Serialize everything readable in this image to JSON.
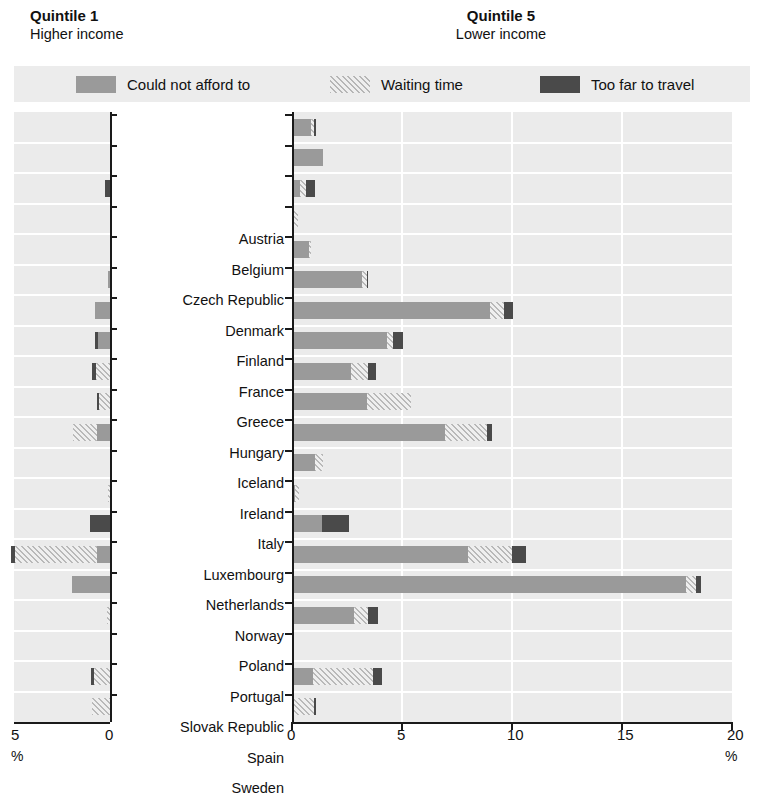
{
  "headers": {
    "left": {
      "title": "Quintile 1",
      "subtitle": "Higher income"
    },
    "right": {
      "title": "Quintile 5",
      "subtitle": "Lower income"
    }
  },
  "legend": {
    "items": [
      {
        "key": "afford",
        "label": "Could not afford to",
        "color": "#9a9a9a"
      },
      {
        "key": "wait",
        "label": "Waiting time",
        "color": "#d8d8d8"
      },
      {
        "key": "travel",
        "label": "Too far to travel",
        "color": "#4a4a4a"
      }
    ]
  },
  "axes": {
    "left": {
      "labels": [
        "5",
        "0"
      ],
      "unit": "%",
      "min": 0,
      "max": 5,
      "ticks": [
        5,
        0
      ],
      "direction": "reversed"
    },
    "right": {
      "labels": [
        "0",
        "5",
        "10",
        "15",
        "20"
      ],
      "unit": "%",
      "min": 0,
      "max": 20,
      "ticks": [
        0,
        5,
        10,
        15,
        20
      ]
    }
  },
  "countries": [
    "Austria",
    "Belgium",
    "Czech Republic",
    "Denmark",
    "Finland",
    "France",
    "Greece",
    "Hungary",
    "Iceland",
    "Ireland",
    "Italy",
    "Luxembourg",
    "Netherlands",
    "Norway",
    "Poland",
    "Portugal",
    "Slovak Republic",
    "Spain",
    "Sweden",
    "United Kingdom"
  ],
  "chart_data": {
    "type": "bar",
    "orientation": "horizontal",
    "layout": "paired-diverging-stacked",
    "title": "",
    "xlabel": "%",
    "ylabel": "",
    "grid": true,
    "legend_position": "top",
    "series": [
      "Could not afford to",
      "Waiting time",
      "Too far to travel"
    ],
    "panels": [
      {
        "name": "Quintile 1",
        "subtitle": "Higher income",
        "xlim": [
          0,
          5
        ],
        "reversed": true,
        "values": {
          "Austria": {
            "afford": 0.0,
            "wait": 0.0,
            "travel": 0.0
          },
          "Belgium": {
            "afford": 0.0,
            "wait": 0.0,
            "travel": 0.0
          },
          "Czech Republic": {
            "afford": 0.0,
            "wait": 0.0,
            "travel": 0.25
          },
          "Denmark": {
            "afford": 0.0,
            "wait": 0.0,
            "travel": 0.0
          },
          "Finland": {
            "afford": 0.0,
            "wait": 0.0,
            "travel": 0.0
          },
          "France": {
            "afford": 0.05,
            "wait": 0.0,
            "travel": 0.0
          },
          "Greece": {
            "afford": 0.8,
            "wait": 0.0,
            "travel": 0.0
          },
          "Hungary": {
            "afford": 0.6,
            "wait": 0.0,
            "travel": 0.2
          },
          "Iceland": {
            "afford": 0.0,
            "wait": 0.75,
            "travel": 0.2
          },
          "Ireland": {
            "afford": 0.0,
            "wait": 0.55,
            "travel": 0.15
          },
          "Italy": {
            "afford": 0.7,
            "wait": 1.25,
            "travel": 0.0
          },
          "Luxembourg": {
            "afford": 0.0,
            "wait": 0.0,
            "travel": 0.0
          },
          "Netherlands": {
            "afford": 0.0,
            "wait": 0.1,
            "travel": 0.0
          },
          "Norway": {
            "afford": 0.0,
            "wait": 0.0,
            "travel": 1.05
          },
          "Poland": {
            "afford": 0.7,
            "wait": 4.25,
            "travel": 0.2
          },
          "Portugal": {
            "afford": 2.0,
            "wait": 0.0,
            "travel": 0.0
          },
          "Slovak Republic": {
            "afford": 0.0,
            "wait": 0.15,
            "travel": 0.0
          },
          "Spain": {
            "afford": 0.0,
            "wait": 0.0,
            "travel": 0.0
          },
          "Sweden": {
            "afford": 0.0,
            "wait": 0.85,
            "travel": 0.15
          },
          "United Kingdom": {
            "afford": 0.0,
            "wait": 0.95,
            "travel": 0.0
          }
        }
      },
      {
        "name": "Quintile 5",
        "subtitle": "Lower income",
        "xlim": [
          0,
          20
        ],
        "reversed": false,
        "values": {
          "Austria": {
            "afford": 0.85,
            "wait": 0.15,
            "travel": 0.1
          },
          "Belgium": {
            "afford": 1.4,
            "wait": 0.0,
            "travel": 0.0
          },
          "Czech Republic": {
            "afford": 0.35,
            "wait": 0.3,
            "travel": 0.4
          },
          "Denmark": {
            "afford": 0.0,
            "wait": 0.25,
            "travel": 0.0
          },
          "Finland": {
            "afford": 0.75,
            "wait": 0.1,
            "travel": 0.0
          },
          "France": {
            "afford": 3.2,
            "wait": 0.2,
            "travel": 0.05
          },
          "Greece": {
            "afford": 9.0,
            "wait": 0.65,
            "travel": 0.4
          },
          "Hungary": {
            "afford": 4.3,
            "wait": 0.3,
            "travel": 0.45
          },
          "Iceland": {
            "afford": 2.7,
            "wait": 0.75,
            "travel": 0.35
          },
          "Ireland": {
            "afford": 3.4,
            "wait": 2.0,
            "travel": 0.0
          },
          "Italy": {
            "afford": 6.95,
            "wait": 1.9,
            "travel": 0.25
          },
          "Luxembourg": {
            "afford": 1.05,
            "wait": 0.35,
            "travel": 0.0
          },
          "Netherlands": {
            "afford": 0.15,
            "wait": 0.15,
            "travel": 0.0
          },
          "Norway": {
            "afford": 1.35,
            "wait": 0.0,
            "travel": 1.25
          },
          "Poland": {
            "afford": 8.0,
            "wait": 2.0,
            "travel": 0.65
          },
          "Portugal": {
            "afford": 17.9,
            "wait": 0.45,
            "travel": 0.25
          },
          "Slovak Republic": {
            "afford": 2.8,
            "wait": 0.65,
            "travel": 0.45
          },
          "Spain": {
            "afford": 0.0,
            "wait": 0.1,
            "travel": 0.0
          },
          "Sweden": {
            "afford": 0.95,
            "wait": 2.75,
            "travel": 0.4
          },
          "United Kingdom": {
            "afford": 0.0,
            "wait": 1.0,
            "travel": 0.1
          }
        }
      }
    ]
  }
}
